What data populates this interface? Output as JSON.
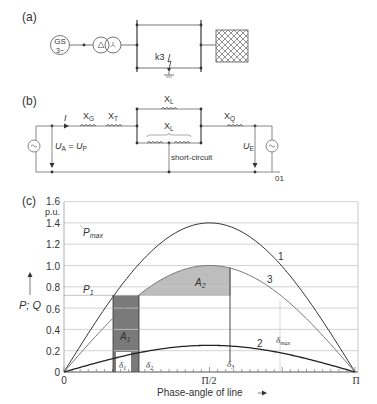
{
  "panel_a": {
    "label": "(a)",
    "generator_line1": "GS",
    "generator_line2": "3~",
    "fault_label": "k3"
  },
  "panel_b": {
    "label": "(b)",
    "current": "I",
    "xg": "X",
    "xg_sub": "G",
    "xt": "X",
    "xt_sub": "T",
    "xl_top": "X",
    "xl_top_sub": "L",
    "xl_bottom": "X",
    "xl_bottom_sub": "L",
    "xq": "X",
    "xq_sub": "Q",
    "ua": "U",
    "ua_sub": "A",
    "ua_eq": " = U",
    "ua_eq_sub": "P",
    "ue": "U",
    "ue_sub": "E",
    "short_circuit": "short-circuit",
    "node": "01"
  },
  "panel_c": {
    "label": "(c)",
    "unit": "p.u.",
    "y_axis_label": "P; Q",
    "x_axis_label": "Phase-angle of line",
    "pmax_label": "P",
    "pmax_sub": "max",
    "p1_label": "P",
    "p1_sub": "1",
    "a1_label": "A",
    "a1_sub": "1",
    "a2_label": "A",
    "a2_sub": "2",
    "d1": "δ",
    "d1_sub": "1",
    "d2": "δ",
    "d2_sub": "2",
    "d3": "δ",
    "d3_sub": "3",
    "dmax": "δ",
    "dmax_sub": "max",
    "curve1": "1",
    "curve2": "2",
    "curve3": "3",
    "x_ticks": [
      "0",
      "Π/2",
      "Π"
    ],
    "y_ticks": [
      "0",
      "0.2",
      "0.4",
      "0.6",
      "0.8",
      "1.0",
      "1.2",
      "1.4",
      "1.6"
    ]
  },
  "chart_data": {
    "type": "line",
    "title": "",
    "xlabel": "Phase-angle of line",
    "ylabel": "P; Q (p.u.)",
    "xlim": [
      0,
      3.1416
    ],
    "ylim": [
      0,
      1.6
    ],
    "x_tick_labels": [
      "0",
      "Π/2",
      "Π"
    ],
    "y_tick_labels": [
      "0",
      "0.2",
      "0.4",
      "0.6",
      "0.8",
      "1.0",
      "1.2",
      "1.4",
      "1.6"
    ],
    "grid": true,
    "series": [
      {
        "name": "1",
        "formula": "1.4*sin(δ)",
        "peak": 1.4
      },
      {
        "name": "2",
        "formula": "0.25*sin(δ)",
        "peak": 0.25
      },
      {
        "name": "3",
        "formula": "1.0*sin(δ)",
        "peak": 1.0
      }
    ],
    "annotations": {
      "P_max": 1.4,
      "P_1": 0.72,
      "delta_1": 0.54,
      "delta_2": 0.8,
      "delta_3": 1.8,
      "delta_max": 2.34,
      "A_1": "area between P1 and curve 2 from δ1 to δ2",
      "A_2": "area between curve 3 and P1 from δ2 to δ3"
    }
  }
}
